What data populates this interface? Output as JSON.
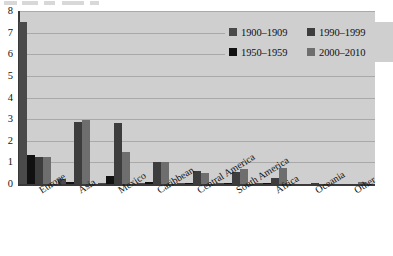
{
  "chart_data": {
    "type": "bar",
    "title": "",
    "subtitle": "",
    "xlabel": "",
    "ylabel": "",
    "ylim": [
      0,
      8
    ],
    "ytick_labels": [
      "8",
      "7",
      "6",
      "5",
      "4",
      "3",
      "2",
      "1",
      "0"
    ],
    "ytick_values": [
      8,
      7,
      6,
      5,
      4,
      3,
      2,
      1,
      0
    ],
    "grid": true,
    "legend_position": "top-right",
    "categories": [
      "Europe",
      "Asia",
      "Mexico",
      "Caribbean",
      "Central America",
      "South America",
      "Africa",
      "Oceania",
      "Other"
    ],
    "series": [
      {
        "name": "1900–1909",
        "color": "#4a4a4a",
        "values": [
          7.5,
          0.25,
          0.05,
          0.05,
          0.03,
          0.04,
          0.03,
          0.0,
          0.0
        ]
      },
      {
        "name": "1950–1959",
        "color": "#111111",
        "values": [
          1.35,
          0.1,
          0.35,
          0.08,
          0.03,
          0.05,
          0.05,
          0.0,
          0.0
        ]
      },
      {
        "name": "1990–1999",
        "color": "#3d3d3d",
        "values": [
          1.25,
          2.85,
          2.8,
          1.0,
          0.6,
          0.55,
          0.3,
          0.05,
          0.0
        ]
      },
      {
        "name": "2000–2010",
        "color": "#6e6e6e",
        "values": [
          1.25,
          2.95,
          1.5,
          1.0,
          0.5,
          0.7,
          0.75,
          0.0,
          0.1
        ]
      }
    ]
  },
  "legend": {
    "entries": [
      {
        "label": "1900–1909",
        "color": "#4a4a4a"
      },
      {
        "label": "1990–1999",
        "color": "#3d3d3d"
      },
      {
        "label": "1950–1959",
        "color": "#111111"
      },
      {
        "label": "2000–2010",
        "color": "#6e6e6e"
      }
    ]
  },
  "colors": {
    "plot_background": "#cfcfcf",
    "gridline": "#a9a9a9",
    "axis": "#3a3a3a",
    "page_background": "#ffffff",
    "text": "#111111"
  }
}
